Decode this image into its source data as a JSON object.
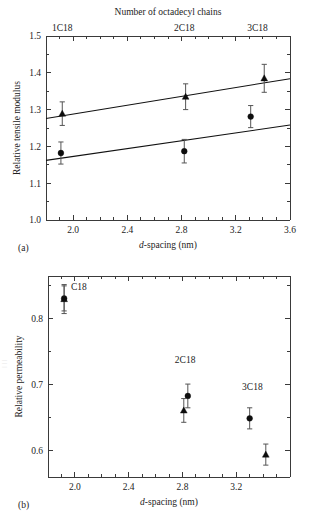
{
  "figure": {
    "top_title": "Number of octadecyl chains",
    "panel_a_label": "(a)",
    "panel_b_label": "(b)"
  },
  "chart_data": [
    {
      "type": "scatter",
      "panel": "(a)",
      "title": "Number of octadecyl chains",
      "xlabel": "d-spacing (nm)",
      "xlabel_italic_prefix": "d",
      "xlabel_rest": "-spacing (nm)",
      "ylabel": "Relative tensile modulus",
      "xlim": [
        1.8,
        3.6
      ],
      "ylim": [
        1.0,
        1.5
      ],
      "xticks": [
        2.0,
        2.4,
        2.8,
        3.2,
        3.6
      ],
      "xticklabels": [
        "2.0",
        "2.4",
        "2.8",
        "3.2",
        "3.6"
      ],
      "xminor_step": 0.1,
      "yticks": [
        1.0,
        1.1,
        1.2,
        1.3,
        1.4,
        1.5
      ],
      "yticklabels": [
        "1.0",
        "1.1",
        "1.2",
        "1.3",
        "1.4",
        "1.5"
      ],
      "yminor_step": 0.05,
      "grid": false,
      "legend": "none",
      "top_axis_labels": [
        {
          "text": "1C18",
          "x": 1.92
        },
        {
          "text": "2C18",
          "x": 2.82
        },
        {
          "text": "3C18",
          "x": 3.36
        }
      ],
      "series": [
        {
          "name": "triangle-series",
          "marker": "triangle",
          "points": [
            {
              "x": 1.92,
              "y": 1.289,
              "yerr": 0.032
            },
            {
              "x": 2.83,
              "y": 1.335,
              "yerr": 0.035
            },
            {
              "x": 3.41,
              "y": 1.385,
              "yerr": 0.038
            }
          ]
        },
        {
          "name": "circle-series",
          "marker": "circle",
          "points": [
            {
              "x": 1.91,
              "y": 1.182,
              "yerr": 0.03
            },
            {
              "x": 2.82,
              "y": 1.187,
              "yerr": 0.032
            },
            {
              "x": 3.31,
              "y": 1.281,
              "yerr": 0.03
            }
          ]
        }
      ],
      "trend_lines": [
        {
          "name": "upper-fit",
          "x0": 1.8,
          "y0": 1.276,
          "x1": 3.6,
          "y1": 1.384
        },
        {
          "name": "lower-fit",
          "x0": 1.8,
          "y0": 1.162,
          "x1": 3.6,
          "y1": 1.258
        }
      ]
    },
    {
      "type": "scatter",
      "panel": "(b)",
      "xlabel": "d-spacing (nm)",
      "xlabel_italic_prefix": "d",
      "xlabel_rest": "-spacing (nm)",
      "ylabel": "Relative permeability",
      "xlim": [
        1.8,
        3.6
      ],
      "ylim": [
        0.56,
        0.865
      ],
      "xticks": [
        2.0,
        2.4,
        2.8,
        3.2
      ],
      "xticklabels": [
        "2.0",
        "2.4",
        "2.8",
        "3.2"
      ],
      "xminor_step": 0.1,
      "yticks": [
        0.6,
        0.7,
        0.8
      ],
      "yticklabels": [
        "0.6",
        "0.7",
        "0.8"
      ],
      "yminor_step": 0.05,
      "grid": false,
      "legend": "none",
      "annotations": [
        {
          "text": "C18",
          "x": 2.03,
          "y": 0.843
        },
        {
          "text": "2C18",
          "x": 2.82,
          "y": 0.733
        },
        {
          "text": "3C18",
          "x": 3.32,
          "y": 0.692
        }
      ],
      "series": [
        {
          "name": "circle-series",
          "marker": "circle",
          "points": [
            {
              "x": 1.92,
              "y": 0.831,
              "yerr": 0.019
            },
            {
              "x": 2.84,
              "y": 0.683,
              "yerr": 0.018
            },
            {
              "x": 3.3,
              "y": 0.649,
              "yerr": 0.016
            }
          ]
        },
        {
          "name": "triangle-series",
          "marker": "triangle",
          "points": [
            {
              "x": 1.92,
              "y": 0.83,
              "yerr": 0.022
            },
            {
              "x": 2.81,
              "y": 0.661,
              "yerr": 0.018
            },
            {
              "x": 3.42,
              "y": 0.594,
              "yerr": 0.016
            }
          ]
        }
      ]
    }
  ]
}
